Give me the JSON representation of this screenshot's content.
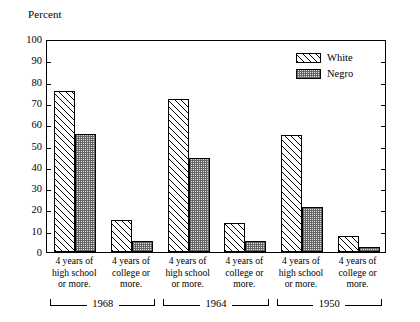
{
  "chart_data": {
    "type": "bar",
    "title": "",
    "ylabel": "Percent",
    "xlabel": "",
    "ylim": [
      0,
      100
    ],
    "ytick_step": 10,
    "yticks": [
      0,
      10,
      20,
      30,
      40,
      50,
      60,
      70,
      80,
      90,
      100
    ],
    "grid": false,
    "legend_position": "top-right",
    "categories": [
      "4 years of high school or more.",
      "4 years of college or more.",
      "4 years of high school or more.",
      "4 years of college or more.",
      "4 years of high school or more.",
      "4 years of college or more."
    ],
    "groups": [
      "1968",
      "1964",
      "1950"
    ],
    "series": [
      {
        "name": "White",
        "values": [
          75.5,
          15,
          72,
          13.5,
          55,
          7.5
        ]
      },
      {
        "name": "Negro",
        "values": [
          55.5,
          5,
          44,
          5,
          21,
          2.5
        ]
      }
    ]
  },
  "axis": {
    "title": "Percent",
    "tick_labels": [
      "100",
      "90",
      "80",
      "70",
      "60",
      "50",
      "40",
      "30",
      "20",
      "10",
      "0"
    ]
  },
  "legend": {
    "items": [
      {
        "label": "White",
        "pattern": "diagonal-hatch"
      },
      {
        "label": "Negro",
        "pattern": "stipple-dots"
      }
    ]
  },
  "categories": [
    {
      "line1": "4 years of",
      "line2": "high school",
      "line3": "or more."
    },
    {
      "line1": "4 years of",
      "line2": "college or",
      "line3": "more."
    },
    {
      "line1": "4 years of",
      "line2": "high school",
      "line3": "or more."
    },
    {
      "line1": "4 years of",
      "line2": "college or",
      "line3": "more."
    },
    {
      "line1": "4 years of",
      "line2": "high school",
      "line3": "or more."
    },
    {
      "line1": "4 years of",
      "line2": "college or",
      "line3": "more."
    }
  ],
  "groups": [
    {
      "year": "1968"
    },
    {
      "year": "1964"
    },
    {
      "year": "1950"
    }
  ]
}
